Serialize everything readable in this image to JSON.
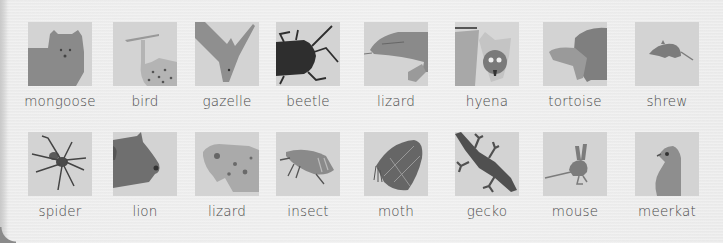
{
  "rows": [
    {
      "items": [
        {
          "label": "mongoose",
          "icon": "mongoose-icon"
        },
        {
          "label": "bird",
          "icon": "bird-icon"
        },
        {
          "label": "gazelle",
          "icon": "gazelle-icon"
        },
        {
          "label": "beetle",
          "icon": "beetle-icon"
        },
        {
          "label": "lizard",
          "icon": "lizard-icon"
        },
        {
          "label": "hyena",
          "icon": "hyena-icon"
        },
        {
          "label": "tortoise",
          "icon": "tortoise-icon"
        },
        {
          "label": "shrew",
          "icon": "shrew-icon"
        }
      ]
    },
    {
      "items": [
        {
          "label": "spider",
          "icon": "spider-icon"
        },
        {
          "label": "lion",
          "icon": "lion-icon"
        },
        {
          "label": "lizard",
          "icon": "lizard-icon"
        },
        {
          "label": "insect",
          "icon": "insect-icon"
        },
        {
          "label": "moth",
          "icon": "moth-icon"
        },
        {
          "label": "gecko",
          "icon": "gecko-icon"
        },
        {
          "label": "mouse",
          "icon": "mouse-icon"
        },
        {
          "label": "meerkat",
          "icon": "meerkat-icon"
        }
      ]
    }
  ],
  "colors": {
    "tile_bg": "#d3d3d3",
    "animal_gray": "#8a8a8a",
    "animal_dark": "#2e2e2e",
    "label_text": "#4a4a4a",
    "panel_bg": "#ececec"
  }
}
